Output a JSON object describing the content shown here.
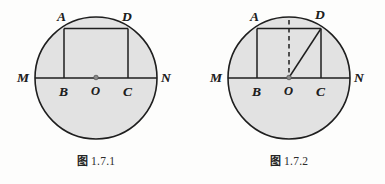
{
  "page": {
    "background_color": "#fdfdfc",
    "ink_color": "#1e1e1e"
  },
  "figures": [
    {
      "id": "fig-1-7-1",
      "caption_cjk": "图",
      "caption_number": "1.7.1",
      "circle": {
        "fill_color": "#e2e2e2",
        "stroke_color": "#1e1e1e",
        "center_label": "O"
      },
      "labels": {
        "A": "A",
        "D": "D",
        "B": "B",
        "C": "C",
        "M": "M",
        "N": "N",
        "O": "O"
      },
      "elements": [
        "circle",
        "diameter-MN",
        "chord-AD",
        "segment-AB",
        "segment-DC",
        "center-point-O"
      ]
    },
    {
      "id": "fig-1-7-2",
      "caption_cjk": "图",
      "caption_number": "1.7.2",
      "circle": {
        "fill_color": "#e2e2e2",
        "stroke_color": "#1e1e1e",
        "center_label": "O"
      },
      "labels": {
        "A": "A",
        "D": "D",
        "B": "B",
        "C": "C",
        "M": "M",
        "N": "N",
        "O": "O"
      },
      "elements": [
        "circle",
        "diameter-MN",
        "chord-AD",
        "segment-AB",
        "segment-DC",
        "dashed-vertical-to-O",
        "radius-OD",
        "center-point-O"
      ]
    }
  ]
}
